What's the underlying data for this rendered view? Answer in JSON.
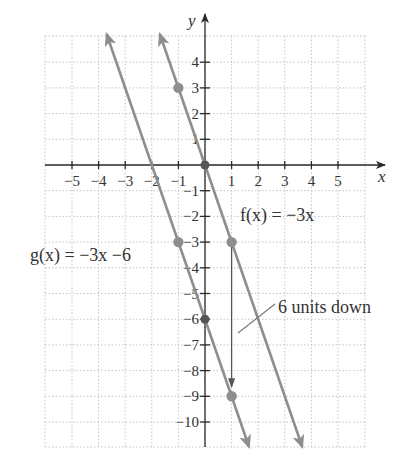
{
  "chart_data": {
    "type": "line",
    "title": "",
    "xlabel": "x",
    "ylabel": "y",
    "xlim": [
      -6,
      6
    ],
    "ylim": [
      -11,
      5
    ],
    "grid": true,
    "x_ticks": [
      -5,
      -4,
      -3,
      -2,
      -1,
      1,
      2,
      3,
      4,
      5
    ],
    "x_tick_labels": [
      "−5",
      "−4",
      "−3",
      "−2",
      "−1",
      "1",
      "2",
      "3",
      "4",
      "5"
    ],
    "y_ticks": [
      4,
      3,
      2,
      1,
      -1,
      -2,
      -3,
      -4,
      -5,
      -6,
      -7,
      -8,
      -9,
      -10
    ],
    "y_tick_labels": [
      "4",
      "3",
      "2",
      "1",
      "−1",
      "−2",
      "−3",
      "−4",
      "−5",
      "−6",
      "−7",
      "−8",
      "−9",
      "−10"
    ],
    "series": [
      {
        "name": "f(x) = −3x",
        "equation": "f(x) = -3x",
        "slope": -3,
        "intercept": 0,
        "points": [
          [
            -1,
            3
          ],
          [
            0,
            0
          ],
          [
            1,
            -3
          ]
        ],
        "color": "#8e8e8e"
      },
      {
        "name": "g(x) = −3x −6",
        "equation": "g(x) = -3x - 6",
        "slope": -3,
        "intercept": -6,
        "points": [
          [
            -1,
            -3
          ],
          [
            0,
            -6
          ],
          [
            1,
            -9
          ]
        ],
        "color": "#8e8e8e"
      }
    ],
    "annotations": [
      {
        "text": "6 units down",
        "arrow_from": [
          1,
          -3
        ],
        "arrow_to": [
          1,
          -9
        ]
      }
    ]
  },
  "labels": {
    "x_axis": "x",
    "y_axis": "y",
    "f_label": "f(x) = −3x",
    "g_label": "g(x) = −3x −6",
    "shift_label": "6 units down"
  },
  "colors": {
    "line": "#8e8e8e",
    "axis": "#2a2a2a",
    "grid": "#c4c4c4",
    "text": "#333333"
  }
}
